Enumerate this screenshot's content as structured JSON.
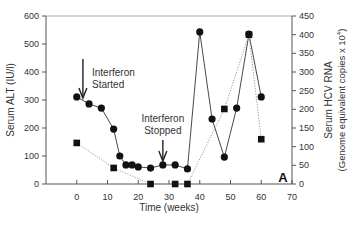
{
  "chart_data": {
    "type": "line",
    "title": "",
    "panel_label": "A",
    "xlabel": "Time (weeks)",
    "ylabel": "Serum ALT (IU/l)",
    "y2label_line1": "Serum HCV RNA",
    "y2label_line2": "(Genome equivalent copies x 10",
    "y2label_sup": "4",
    "y2label_close": ")",
    "xlim": [
      -10,
      70
    ],
    "ylim": [
      0,
      600
    ],
    "y2lim": [
      0,
      450
    ],
    "xticks": [
      0,
      10,
      20,
      30,
      40,
      50,
      60,
      70
    ],
    "yticks": [
      0,
      100,
      200,
      300,
      400,
      500,
      600
    ],
    "y2ticks": [
      0,
      50,
      100,
      150,
      200,
      250,
      300,
      350,
      400,
      450
    ],
    "grid": false,
    "series": [
      {
        "name": "Serum ALT",
        "axis": "left",
        "marker": "circle",
        "line": "solid",
        "x": [
          0,
          4,
          8,
          12,
          14,
          16,
          18,
          20,
          24,
          28,
          32,
          36,
          40,
          44,
          48,
          52,
          56,
          60
        ],
        "values": [
          311,
          286,
          271,
          196,
          100,
          68,
          68,
          61,
          57,
          68,
          68,
          54,
          543,
          232,
          96,
          271,
          535,
          311
        ]
      },
      {
        "name": "Serum HCV RNA",
        "axis": "right",
        "marker": "square",
        "line": "dotted",
        "x": [
          0,
          12,
          24,
          32,
          36,
          48,
          56,
          60
        ],
        "values": [
          110,
          43,
          0,
          0,
          0,
          201,
          400,
          120
        ]
      }
    ],
    "annotations": [
      {
        "line1": "Interferon",
        "line2": "Started",
        "arrow_x": 2,
        "arrow_y_top": 590,
        "arrow_y_bottom": 0
      },
      {
        "line1": "Interferon",
        "line2": "Stopped",
        "arrow_x": 28,
        "arrow_y_top": 0,
        "arrow_y_bottom": 0
      }
    ],
    "legend": "none"
  }
}
